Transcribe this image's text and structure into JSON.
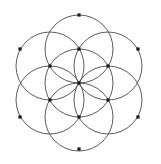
{
  "figure": {
    "caption": "Seven overlapping circles of equal radius forming a hexagonal rosette, with square markers at each intersection node.",
    "background_color": "#ffffff",
    "stroke_color": "#4a4a4a",
    "vertex_color": "#1a1a1a",
    "canvas": {
      "width": 161,
      "height": 164
    }
  },
  "chart_data": {
    "type": "scatter",
    "xlabel": "",
    "ylabel": "",
    "grid": false,
    "legend": "none",
    "xlim": [
      0,
      161
    ],
    "ylim": [
      0,
      164
    ],
    "geometry": {
      "center": {
        "x": 79,
        "y": 83
      },
      "circle_radius": 34,
      "ring_radius": 34,
      "outer_vertex_radius": 68
    },
    "circles": [
      {
        "name": "center-circle",
        "cx": 79,
        "cy": 83,
        "r": 34
      },
      {
        "name": "circle-top",
        "cx": 79,
        "cy": 49,
        "r": 34
      },
      {
        "name": "circle-upper-right",
        "cx": 108,
        "cy": 66,
        "r": 34
      },
      {
        "name": "circle-lower-right",
        "cx": 108,
        "cy": 100,
        "r": 34
      },
      {
        "name": "circle-bottom",
        "cx": 79,
        "cy": 117,
        "r": 34
      },
      {
        "name": "circle-lower-left",
        "cx": 50,
        "cy": 100,
        "r": 34
      },
      {
        "name": "circle-upper-left",
        "cx": 50,
        "cy": 66,
        "r": 34
      }
    ],
    "vertices": [
      {
        "name": "vertex-center",
        "x": 79,
        "y": 83,
        "ring": "center"
      },
      {
        "name": "vertex-inner-top",
        "x": 79,
        "y": 49,
        "ring": "inner"
      },
      {
        "name": "vertex-inner-upper-right",
        "x": 108,
        "y": 66,
        "ring": "inner"
      },
      {
        "name": "vertex-inner-lower-right",
        "x": 108,
        "y": 100,
        "ring": "inner"
      },
      {
        "name": "vertex-inner-bottom",
        "x": 79,
        "y": 117,
        "ring": "inner"
      },
      {
        "name": "vertex-inner-lower-left",
        "x": 50,
        "y": 100,
        "ring": "inner"
      },
      {
        "name": "vertex-inner-upper-left",
        "x": 50,
        "y": 66,
        "ring": "inner"
      },
      {
        "name": "vertex-outer-top",
        "x": 79,
        "y": 15,
        "ring": "outer"
      },
      {
        "name": "vertex-outer-upper-right",
        "x": 138,
        "y": 49,
        "ring": "outer"
      },
      {
        "name": "vertex-outer-lower-right",
        "x": 138,
        "y": 117,
        "ring": "outer"
      },
      {
        "name": "vertex-outer-bottom",
        "x": 79,
        "y": 149,
        "ring": "outer"
      },
      {
        "name": "vertex-outer-lower-left",
        "x": 20,
        "y": 117,
        "ring": "outer"
      },
      {
        "name": "vertex-outer-upper-left",
        "x": 20,
        "y": 49,
        "ring": "outer"
      }
    ],
    "vertex_marker": {
      "shape": "square",
      "size": 3.2
    },
    "counts": {
      "circles": 7,
      "vertices": 13
    }
  }
}
